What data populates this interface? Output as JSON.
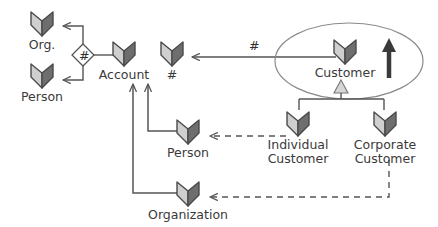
{
  "diagram": {
    "type": "entity-relationship",
    "background": "#ffffff",
    "line_color": "#555555",
    "text_color": "#3a3a3a",
    "icon_light": "#cfcfcf",
    "icon_dark": "#6e6e6e",
    "icon_outline": "#4a4a4a"
  },
  "nodes": [
    {
      "id": "org",
      "label": "Org.",
      "icon": "entity-chevron-icon",
      "x": 42,
      "y": 10
    },
    {
      "id": "person_l",
      "label": "Person",
      "icon": "entity-chevron-icon",
      "x": 42,
      "y": 62
    },
    {
      "id": "account",
      "label": "Account",
      "icon": "entity-chevron-icon",
      "x": 124,
      "y": 40
    },
    {
      "id": "hash_ent",
      "label": "#",
      "icon": "entity-chevron-icon",
      "x": 172,
      "y": 40
    },
    {
      "id": "customer",
      "label": "Customer",
      "icon": "entity-chevron-icon",
      "x": 345,
      "y": 38
    },
    {
      "id": "individual",
      "label": "Individual\nCustomer",
      "icon": "entity-chevron-icon",
      "x": 298,
      "y": 110
    },
    {
      "id": "corporate",
      "label": "Corporate\nCustomer",
      "icon": "entity-chevron-icon",
      "x": 385,
      "y": 110
    },
    {
      "id": "person_r",
      "label": "Person",
      "icon": "entity-chevron-icon",
      "x": 188,
      "y": 118
    },
    {
      "id": "orgn",
      "label": "Organization",
      "icon": "entity-chevron-icon",
      "x": 188,
      "y": 180
    }
  ],
  "edge_labels": [
    {
      "id": "diamond_hash",
      "text": "#",
      "x": 79,
      "y": 49
    },
    {
      "id": "relation_hash",
      "text": "#",
      "x": 249,
      "y": 39
    }
  ],
  "shapes": {
    "ellipse": {
      "name": "customer-grouping-ellipse",
      "cx": 349,
      "cy": 61,
      "rx": 74,
      "ry": 38
    },
    "diamond": {
      "name": "hash-relationship-diamond",
      "cx": 83,
      "cy": 55,
      "r": 11
    },
    "generalization_triangle": {
      "name": "generalization-triangle",
      "cx": 341,
      "cy": 88
    },
    "emphasis_arrow": {
      "name": "emphasis-up-arrow",
      "x": 389,
      "y": 38
    }
  }
}
